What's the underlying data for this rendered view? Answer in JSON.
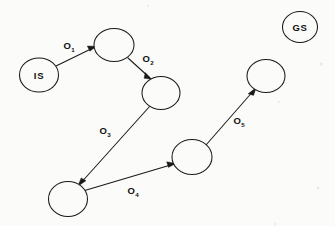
{
  "diagram": {
    "width": 335,
    "height": 226,
    "background_color": "#fbfbf9",
    "stroke_color": "#1a1a1a",
    "nodes": [
      {
        "id": "initial-state",
        "label": "IS",
        "cx": 39,
        "cy": 75,
        "rx": 19.5,
        "ry": 17.0,
        "has_label": true
      },
      {
        "id": "state-1",
        "label": "",
        "cx": 114,
        "cy": 45,
        "rx": 20.0,
        "ry": 16.5,
        "has_label": false
      },
      {
        "id": "state-2",
        "label": "",
        "cx": 161,
        "cy": 93,
        "rx": 19.0,
        "ry": 16.5,
        "has_label": false
      },
      {
        "id": "state-3",
        "label": "",
        "cx": 68,
        "cy": 199,
        "rx": 19.5,
        "ry": 17.5,
        "has_label": false
      },
      {
        "id": "state-4",
        "label": "",
        "cx": 192,
        "cy": 157,
        "rx": 20.0,
        "ry": 17.5,
        "has_label": false
      },
      {
        "id": "state-5",
        "label": "",
        "cx": 266,
        "cy": 76,
        "rx": 19.0,
        "ry": 16.5,
        "has_label": false
      },
      {
        "id": "goal-state",
        "label": "GS",
        "cx": 300,
        "cy": 27,
        "rx": 17.5,
        "ry": 15.5,
        "has_label": true
      }
    ],
    "edges": [
      {
        "id": "edge-o1",
        "label_base": "O",
        "label_sub": "1",
        "from": "initial-state",
        "to": "state-1",
        "x1": 56,
        "y1": 66,
        "x2": 95,
        "y2": 47,
        "label_x": 69,
        "label_y": 49
      },
      {
        "id": "edge-o2",
        "label_base": "O",
        "label_sub": "2",
        "from": "state-1",
        "to": "state-2",
        "x1": 128,
        "y1": 58,
        "x2": 150,
        "y2": 78,
        "label_x": 148,
        "label_y": 62
      },
      {
        "id": "edge-o3",
        "label_base": "O",
        "label_sub": "3",
        "from": "state-2",
        "to": "state-3",
        "x1": 150,
        "y1": 106,
        "x2": 79,
        "y2": 185,
        "label_x": 105,
        "label_y": 134
      },
      {
        "id": "edge-o4",
        "label_base": "O",
        "label_sub": "4",
        "from": "state-3",
        "to": "state-4",
        "x1": 83,
        "y1": 191,
        "x2": 174,
        "y2": 164,
        "label_x": 133,
        "label_y": 194
      },
      {
        "id": "edge-o5",
        "label_base": "O",
        "label_sub": "5",
        "from": "state-4",
        "to": "state-5",
        "x1": 206,
        "y1": 145,
        "x2": 255,
        "y2": 89,
        "label_x": 239,
        "label_y": 124
      }
    ]
  }
}
